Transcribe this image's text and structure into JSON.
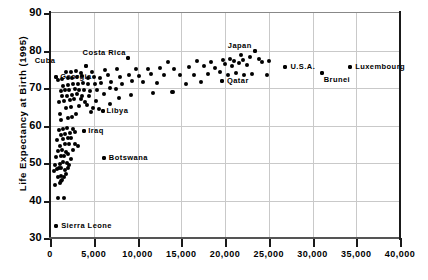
{
  "chart_data": {
    "type": "scatter",
    "title": "",
    "xlabel": "",
    "ylabel": "Life Expectancy at Birth (1995)",
    "xlim": [
      0,
      40000
    ],
    "ylim": [
      30,
      90
    ],
    "grid": true,
    "legend": null,
    "xticks": [
      0,
      5000,
      10000,
      15000,
      20000,
      25000,
      30000,
      35000,
      40000
    ],
    "xtick_labels": [
      "0",
      "5,000",
      "10,000",
      "15,000",
      "20,000",
      "25,000",
      "30,000",
      "35,000",
      "40,000"
    ],
    "yticks": [
      30,
      40,
      50,
      60,
      70,
      80,
      90
    ],
    "ytick_labels": [
      "30",
      "40",
      "50",
      "60",
      "70",
      "80",
      "90"
    ],
    "marker_color": "#000000",
    "grid_color": "#c9c9c9",
    "annotations": [
      {
        "label": "Cuba",
        "x": 4150,
        "y": 75.8,
        "label_dx": -31,
        "label_dy": -6
      },
      {
        "label": "Georgia",
        "x": 700,
        "y": 72.9,
        "label_dx": 4,
        "label_dy": -1
      },
      {
        "label": "Costa Rica",
        "x": 8900,
        "y": 78.0,
        "label_dx": -2,
        "label_dy": -6
      },
      {
        "label": "Libya",
        "x": 6000,
        "y": 64.0,
        "label_dx": 4,
        "label_dy": -1
      },
      {
        "label": "Iraq",
        "x": 3900,
        "y": 58.5,
        "label_dx": 4,
        "label_dy": -1
      },
      {
        "label": "Botswana",
        "x": 6150,
        "y": 51.4,
        "label_dx": 5,
        "label_dy": -1
      },
      {
        "label": "Sierra Leone",
        "x": 700,
        "y": 33.1,
        "label_dx": 5,
        "label_dy": -1
      },
      {
        "label": "Qatar",
        "x": 19650,
        "y": 72.0,
        "label_dx": 5,
        "label_dy": -1
      },
      {
        "label": "Japan",
        "x": 23400,
        "y": 79.8,
        "label_dx": -3,
        "label_dy": -6
      },
      {
        "label": "U.S.A.",
        "x": 26900,
        "y": 75.5,
        "label_dx": 5,
        "label_dy": -1
      },
      {
        "label": "Brunei",
        "x": 31050,
        "y": 74.0,
        "label_dx": 2,
        "label_dy": 6
      },
      {
        "label": "Luxembourg",
        "x": 34300,
        "y": 75.6,
        "label_dx": 5,
        "label_dy": -1
      }
    ],
    "points": [
      [
        700,
        33.1
      ],
      [
        900,
        40.8
      ],
      [
        1550,
        40.8
      ],
      [
        600,
        44.2
      ],
      [
        1100,
        44.6
      ],
      [
        1250,
        45.2
      ],
      [
        1400,
        45.6
      ],
      [
        900,
        46.4
      ],
      [
        1200,
        46.6
      ],
      [
        1600,
        46.2
      ],
      [
        1850,
        47.0
      ],
      [
        500,
        48.0
      ],
      [
        800,
        48.4
      ],
      [
        1000,
        48.8
      ],
      [
        1300,
        48.6
      ],
      [
        1700,
        48.2
      ],
      [
        2000,
        48.8
      ],
      [
        600,
        49.6
      ],
      [
        1150,
        49.8
      ],
      [
        1500,
        50.2
      ],
      [
        1900,
        50.0
      ],
      [
        2150,
        49.4
      ],
      [
        6150,
        51.4
      ],
      [
        700,
        51.6
      ],
      [
        1250,
        51.8
      ],
      [
        1650,
        52.0
      ],
      [
        2050,
        52.4
      ],
      [
        2400,
        51.0
      ],
      [
        900,
        53.2
      ],
      [
        1400,
        53.6
      ],
      [
        1800,
        53.0
      ],
      [
        2600,
        53.4
      ],
      [
        1100,
        54.6
      ],
      [
        1700,
        55.0
      ],
      [
        2200,
        55.2
      ],
      [
        2900,
        55.0
      ],
      [
        3150,
        54.6
      ],
      [
        800,
        56.2
      ],
      [
        1500,
        56.4
      ],
      [
        2000,
        56.8
      ],
      [
        2450,
        56.6
      ],
      [
        1200,
        57.6
      ],
      [
        1750,
        57.8
      ],
      [
        2300,
        58.0
      ],
      [
        2800,
        58.2
      ],
      [
        3900,
        58.5
      ],
      [
        1000,
        58.8
      ],
      [
        1450,
        59.0
      ],
      [
        1900,
        59.4
      ],
      [
        2600,
        59.2
      ],
      [
        1300,
        61.6
      ],
      [
        2100,
        62.0
      ],
      [
        2550,
        62.4
      ],
      [
        1150,
        63.0
      ],
      [
        3000,
        63.2
      ],
      [
        6000,
        64.0
      ],
      [
        1850,
        64.6
      ],
      [
        2350,
        65.0
      ],
      [
        3350,
        65.2
      ],
      [
        4200,
        65.4
      ],
      [
        4900,
        64.8
      ],
      [
        1000,
        66.2
      ],
      [
        1600,
        66.6
      ],
      [
        2250,
        66.8
      ],
      [
        2700,
        67.0
      ],
      [
        3550,
        67.2
      ],
      [
        4050,
        66.4
      ],
      [
        5250,
        66.6
      ],
      [
        1350,
        67.8
      ],
      [
        1950,
        68.0
      ],
      [
        2500,
        68.2
      ],
      [
        3100,
        68.4
      ],
      [
        3700,
        68.0
      ],
      [
        4400,
        67.8
      ],
      [
        6200,
        68.4
      ],
      [
        13900,
        69.0
      ],
      [
        1200,
        69.2
      ],
      [
        1700,
        69.4
      ],
      [
        2200,
        69.6
      ],
      [
        2800,
        69.8
      ],
      [
        3300,
        69.6
      ],
      [
        3900,
        69.4
      ],
      [
        4600,
        69.2
      ],
      [
        5400,
        69.6
      ],
      [
        6800,
        70.0
      ],
      [
        7500,
        69.8
      ],
      [
        1500,
        70.6
      ],
      [
        2100,
        70.8
      ],
      [
        2650,
        71.0
      ],
      [
        3200,
        71.2
      ],
      [
        3750,
        71.4
      ],
      [
        4350,
        71.0
      ],
      [
        5100,
        71.2
      ],
      [
        5800,
        71.4
      ],
      [
        7000,
        71.6
      ],
      [
        8200,
        71.2
      ],
      [
        9400,
        71.8
      ],
      [
        10600,
        71.6
      ],
      [
        12200,
        71.4
      ],
      [
        15500,
        71.2
      ],
      [
        17200,
        71.6
      ],
      [
        19650,
        72.0
      ],
      [
        900,
        72.2
      ],
      [
        1400,
        72.5
      ],
      [
        700,
        72.9
      ],
      [
        2000,
        72.6
      ],
      [
        2550,
        72.8
      ],
      [
        3100,
        73.0
      ],
      [
        3650,
        73.2
      ],
      [
        4300,
        72.8
      ],
      [
        5000,
        73.0
      ],
      [
        5700,
        72.6
      ],
      [
        6600,
        73.4
      ],
      [
        8000,
        73.0
      ],
      [
        9000,
        73.6
      ],
      [
        10200,
        73.2
      ],
      [
        11500,
        73.8
      ],
      [
        13000,
        73.4
      ],
      [
        14800,
        73.6
      ],
      [
        16400,
        73.4
      ],
      [
        18100,
        73.8
      ],
      [
        19400,
        74.2
      ],
      [
        20300,
        73.6
      ],
      [
        21300,
        74.0
      ],
      [
        22200,
        73.6
      ],
      [
        23100,
        73.8
      ],
      [
        24800,
        73.4
      ],
      [
        31050,
        74.0
      ],
      [
        1800,
        74.2
      ],
      [
        2400,
        74.4
      ],
      [
        3000,
        74.6
      ],
      [
        3500,
        74.0
      ],
      [
        4150,
        75.8
      ],
      [
        4800,
        74.4
      ],
      [
        6300,
        74.8
      ],
      [
        7600,
        75.0
      ],
      [
        8900,
        78.0
      ],
      [
        9800,
        75.2
      ],
      [
        11200,
        75.0
      ],
      [
        12600,
        75.4
      ],
      [
        14200,
        75.2
      ],
      [
        15900,
        75.6
      ],
      [
        17600,
        75.8
      ],
      [
        18800,
        75.4
      ],
      [
        20000,
        76.4
      ],
      [
        20800,
        76.0
      ],
      [
        21600,
        76.6
      ],
      [
        22500,
        76.2
      ],
      [
        26900,
        75.5
      ],
      [
        34300,
        75.6
      ],
      [
        13500,
        77.0
      ],
      [
        16800,
        77.2
      ],
      [
        18400,
        77.0
      ],
      [
        19800,
        77.4
      ],
      [
        21000,
        77.2
      ],
      [
        22000,
        77.6
      ],
      [
        23400,
        79.8
      ],
      [
        24200,
        77.0
      ],
      [
        25000,
        77.2
      ],
      [
        22800,
        78.4
      ],
      [
        21800,
        78.8
      ],
      [
        20600,
        77.8
      ],
      [
        23900,
        77.8
      ],
      [
        14000,
        68.9
      ],
      [
        11800,
        68.6
      ],
      [
        9200,
        68.2
      ],
      [
        7900,
        67.4
      ],
      [
        6900,
        65.8
      ],
      [
        5600,
        64.4
      ],
      [
        4700,
        63.6
      ]
    ]
  }
}
